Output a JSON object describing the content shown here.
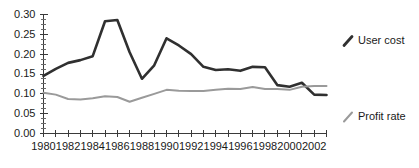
{
  "chart_data": {
    "type": "line",
    "title": "",
    "xlabel": "",
    "ylabel": "",
    "xlim": [
      1980,
      2003
    ],
    "ylim": [
      0.0,
      0.3
    ],
    "grid": false,
    "legend_position": "right",
    "x": [
      1980,
      1981,
      1982,
      1983,
      1984,
      1985,
      1986,
      1987,
      1988,
      1989,
      1990,
      1991,
      1992,
      1993,
      1994,
      1995,
      1996,
      1997,
      1998,
      1999,
      2000,
      2001,
      2002,
      2003
    ],
    "y_ticks": [
      "0.00",
      "0.05",
      "0.10",
      "0.15",
      "0.20",
      "0.25",
      "0.30"
    ],
    "y_tick_values": [
      0.0,
      0.05,
      0.1,
      0.15,
      0.2,
      0.25,
      0.3
    ],
    "x_ticks_labeled": [
      "1980",
      "1982",
      "1984",
      "1986",
      "1988",
      "1990",
      "1992",
      "1994",
      "1996",
      "1998",
      "2000",
      "2002"
    ],
    "x_tick_values_labeled": [
      1980,
      1982,
      1984,
      1986,
      1988,
      1990,
      1992,
      1994,
      1996,
      1998,
      2000,
      2002
    ],
    "series": [
      {
        "name": "User cost",
        "color": "#303030",
        "width": 2.6,
        "values": [
          0.145,
          0.163,
          0.178,
          0.185,
          0.195,
          0.283,
          0.286,
          0.205,
          0.138,
          0.172,
          0.24,
          0.222,
          0.2,
          0.168,
          0.16,
          0.162,
          0.158,
          0.168,
          0.167,
          0.122,
          0.118,
          0.128,
          0.098,
          0.097
        ]
      },
      {
        "name": "Profit rate",
        "color": "#9a9a9a",
        "width": 2.0,
        "values": [
          0.103,
          0.098,
          0.087,
          0.086,
          0.089,
          0.094,
          0.092,
          0.08,
          0.09,
          0.1,
          0.11,
          0.108,
          0.107,
          0.107,
          0.11,
          0.113,
          0.112,
          0.117,
          0.112,
          0.112,
          0.11,
          0.118,
          0.12,
          0.12
        ]
      }
    ]
  },
  "legend": {
    "items": [
      {
        "label": "User cost",
        "color": "#303030"
      },
      {
        "label": "Profit rate",
        "color": "#9a9a9a"
      }
    ]
  }
}
